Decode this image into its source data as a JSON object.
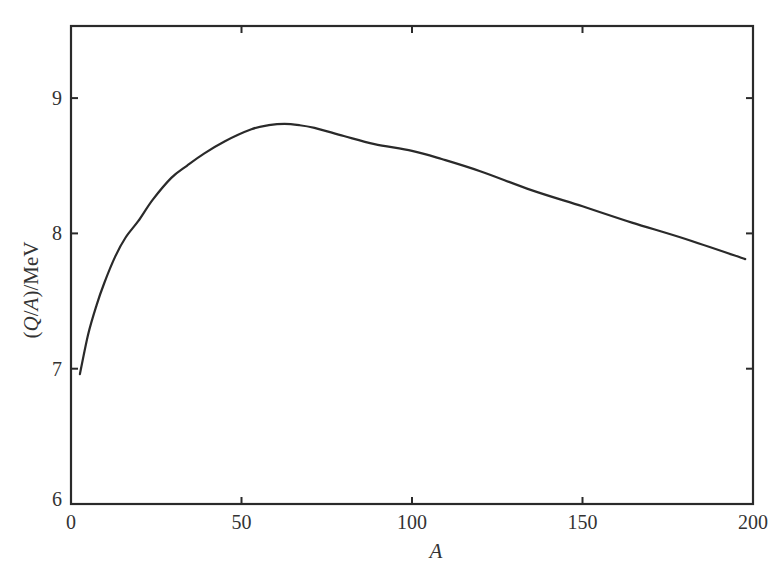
{
  "chart_data": {
    "type": "line",
    "title": "",
    "xlabel": "A",
    "ylabel": "(Q/A)/MeV",
    "ylabel_parts": {
      "open": "(",
      "q": "Q",
      "slash": "/",
      "a": "A",
      "close": ")/MeV"
    },
    "xlim": [
      0,
      200
    ],
    "ylim": [
      6,
      9.5
    ],
    "x_ticks": [
      0,
      50,
      100,
      150,
      200
    ],
    "x_tick_labels": [
      "0",
      "50",
      "100",
      "150",
      "200"
    ],
    "y_ticks": [
      6,
      7,
      8,
      9
    ],
    "y_tick_labels": [
      "6",
      "7",
      "8",
      "9"
    ],
    "grid": false,
    "legend": null,
    "series": [
      {
        "name": "binding energy per nucleon",
        "color": "#2a2a2a",
        "x": [
          2.6,
          5,
          7.5,
          9.7,
          13,
          16,
          19.7,
          24,
          29.4,
          34,
          39,
          45,
          52.9,
          58,
          62.6,
          67,
          71.4,
          80,
          89,
          100,
          108.7,
          120,
          135,
          150,
          164.5,
          180,
          197.7
        ],
        "y": [
          6.96,
          7.25,
          7.47,
          7.63,
          7.83,
          7.97,
          8.09,
          8.25,
          8.41,
          8.5,
          8.59,
          8.68,
          8.77,
          8.8,
          8.81,
          8.8,
          8.78,
          8.72,
          8.66,
          8.61,
          8.55,
          8.46,
          8.32,
          8.2,
          8.08,
          7.96,
          7.81
        ]
      }
    ]
  }
}
